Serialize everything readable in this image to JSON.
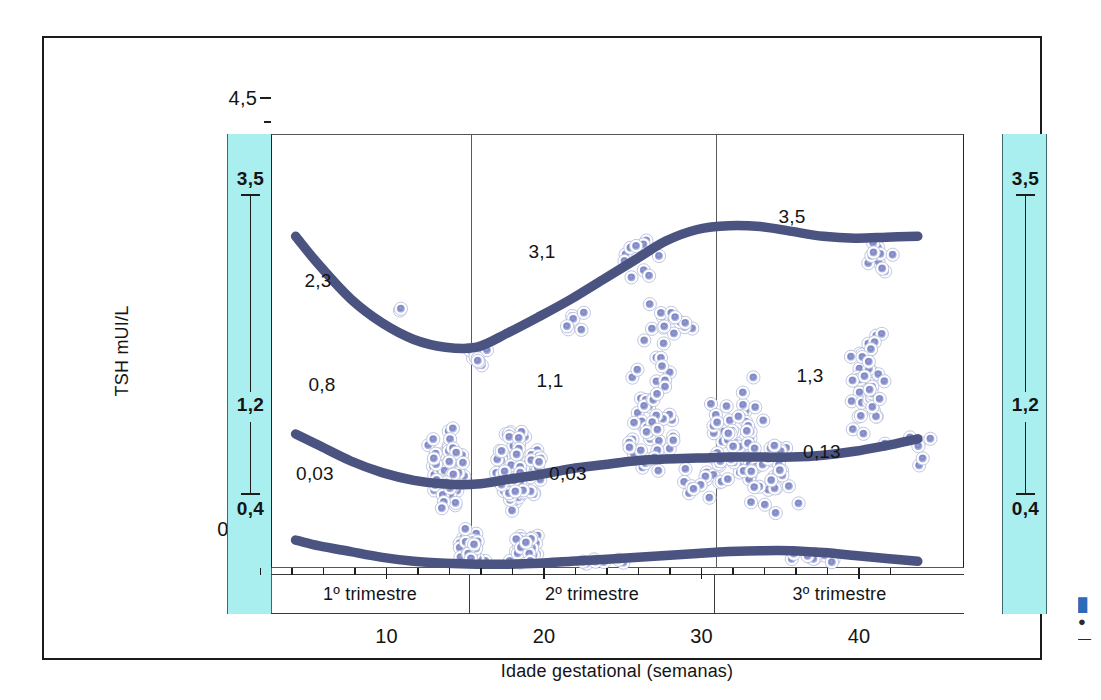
{
  "figure": {
    "y_axis": {
      "title": "TSH mUI/L",
      "tick_labels": [
        "4,5",
        "3,5",
        "2,5",
        "1,5",
        "0,5",
        "0,03"
      ],
      "tick_values": [
        4.5,
        3.5,
        2.5,
        1.5,
        0.5,
        0.03
      ]
    },
    "x_axis": {
      "title": "Idade gestational (semanas)",
      "tick_labels": [
        "10",
        "20",
        "30",
        "40"
      ],
      "tick_values": [
        10,
        20,
        30,
        40
      ]
    },
    "trimesters": [
      {
        "label": "1º trimestre"
      },
      {
        "label": "2º trimestre"
      },
      {
        "label": "3º trimestre"
      }
    ],
    "reference_bands": {
      "left": {
        "upper": "3,5",
        "middle": "1,2",
        "lower": "0,4"
      },
      "right": {
        "upper": "3,5",
        "middle": "1,2",
        "lower": "0,4"
      }
    },
    "curve_annotations": [
      {
        "text": "2,3",
        "x": 316,
        "y": 279
      },
      {
        "text": "3,1",
        "x": 540,
        "y": 250
      },
      {
        "text": "3,5",
        "x": 790,
        "y": 215
      },
      {
        "text": "0,8",
        "x": 320,
        "y": 383
      },
      {
        "text": "1,1",
        "x": 548,
        "y": 379
      },
      {
        "text": "1,3",
        "x": 808,
        "y": 374
      },
      {
        "text": "0,03",
        "x": 313,
        "y": 472
      },
      {
        "text": "0,03",
        "x": 566,
        "y": 472
      },
      {
        "text": "0,13",
        "x": 820,
        "y": 450
      }
    ],
    "colors": {
      "band_fill": "#a9efef",
      "curve": "#4b5380",
      "point_fill": "#7c85c4",
      "point_ring": "#ffffff",
      "frame": "#1b1b1b"
    }
  },
  "chart_data": {
    "type": "scatter",
    "title": "",
    "xlabel": "Idade gestational (semanas)",
    "ylabel": "TSH mUI/L",
    "xlim": [
      0,
      44
    ],
    "ylim": [
      0.03,
      4.5
    ],
    "xticks": [
      10,
      20,
      30,
      40
    ],
    "yticks": [
      0.03,
      0.5,
      1.5,
      2.5,
      3.5,
      4.5
    ],
    "ytick_labels": [
      "0,03",
      "0,5",
      "1,5",
      "2,5",
      "3,5",
      "4,5"
    ],
    "grid": false,
    "legend": "none",
    "annotations": [
      "2,3",
      "3,1",
      "3,5",
      "0,8",
      "1,1",
      "1,3",
      "0,03",
      "0,03",
      "0,13"
    ],
    "reference_intervals": {
      "label": "Faixa de referência (bandas ciano)",
      "upper_limit": 3.5,
      "median": 1.2,
      "lower_limit": 0.4
    },
    "trimester_boundaries_weeks": [
      0,
      13.5,
      27,
      44
    ],
    "series": [
      {
        "name": "Percentil superior (97,5)",
        "type": "line",
        "x": [
          1.5,
          3,
          5,
          7,
          9,
          11,
          13,
          15,
          17,
          19,
          21,
          23,
          25,
          27,
          29,
          31,
          33,
          35,
          37,
          39,
          41
        ],
        "y": [
          3.45,
          3.15,
          2.8,
          2.55,
          2.38,
          2.3,
          2.3,
          2.45,
          2.62,
          2.8,
          3.0,
          3.2,
          3.4,
          3.52,
          3.56,
          3.55,
          3.5,
          3.45,
          3.43,
          3.44,
          3.45
        ],
        "labels": [
          "2,3",
          "3,1",
          "3,5"
        ]
      },
      {
        "name": "Mediana",
        "type": "line",
        "x": [
          1.5,
          3,
          5,
          7,
          9,
          11,
          13,
          15,
          17,
          19,
          21,
          23,
          25,
          27,
          29,
          31,
          33,
          35,
          37,
          39,
          41
        ],
        "y": [
          1.4,
          1.28,
          1.12,
          1.0,
          0.92,
          0.88,
          0.88,
          0.93,
          0.98,
          1.04,
          1.08,
          1.12,
          1.14,
          1.15,
          1.16,
          1.16,
          1.16,
          1.18,
          1.22,
          1.28,
          1.35
        ],
        "labels": [
          "0,8",
          "1,1",
          "1,3"
        ]
      },
      {
        "name": "Percentil inferior (2,5)",
        "type": "line",
        "x": [
          1.5,
          3,
          5,
          7,
          9,
          11,
          13,
          15,
          17,
          19,
          21,
          23,
          25,
          27,
          29,
          31,
          33,
          35,
          37,
          39,
          41
        ],
        "y": [
          0.3,
          0.24,
          0.18,
          0.12,
          0.08,
          0.06,
          0.05,
          0.05,
          0.06,
          0.08,
          0.1,
          0.12,
          0.14,
          0.16,
          0.18,
          0.19,
          0.19,
          0.17,
          0.14,
          0.11,
          0.08
        ],
        "labels": [
          "0,03",
          "0,03",
          "0,13"
        ]
      },
      {
        "name": "Medidas individuais de TSH",
        "type": "scatter",
        "note": "Nuvem de pontos individuais; densidade maxima entre 10-17 e 23-33 semanas"
      }
    ]
  },
  "edge_caption": {
    "line1": "█",
    "line2": "●",
    "line3": "—"
  }
}
